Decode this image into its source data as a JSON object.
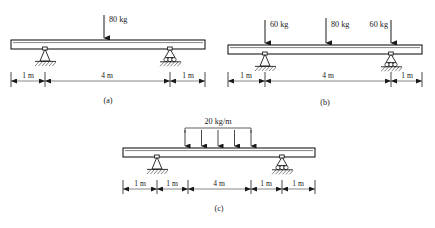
{
  "figure": {
    "background_color": "#ffffff",
    "line_color": "#1a1a1a",
    "dim_line_color": "#555555",
    "units": "m"
  },
  "panels": [
    {
      "id": "a",
      "caption": "(a)",
      "loads": [
        {
          "label": "80 kg",
          "magnitude": 80,
          "unit": "kg",
          "type": "point",
          "position_m": 3.0
        }
      ],
      "supports": [
        {
          "type": "pin",
          "position_m": 1.0
        },
        {
          "type": "roller",
          "position_m": 5.0
        }
      ],
      "dimensions": [
        {
          "label": "1 m",
          "value": 1
        },
        {
          "label": "4 m",
          "value": 4
        },
        {
          "label": "1 m",
          "value": 1
        }
      ],
      "beam_length_m": 6
    },
    {
      "id": "b",
      "caption": "(b)",
      "loads": [
        {
          "label": "60 kg",
          "magnitude": 60,
          "unit": "kg",
          "type": "point",
          "position_m": 1.0
        },
        {
          "label": "80 kg",
          "magnitude": 80,
          "unit": "kg",
          "type": "point",
          "position_m": 3.0
        },
        {
          "label": "60 kg",
          "magnitude": 60,
          "unit": "kg",
          "type": "point",
          "position_m": 5.0
        }
      ],
      "supports": [
        {
          "type": "pin",
          "position_m": 1.0
        },
        {
          "type": "roller",
          "position_m": 5.0
        }
      ],
      "dimensions": [
        {
          "label": "1 m",
          "value": 1
        },
        {
          "label": "4 m",
          "value": 4
        },
        {
          "label": "1 m",
          "value": 1
        }
      ],
      "beam_length_m": 6
    },
    {
      "id": "c",
      "caption": "(c)",
      "loads": [
        {
          "label": "20 kg/m",
          "magnitude": 20,
          "unit": "kg/m",
          "type": "distributed",
          "start_m": 3.0,
          "end_m": 5.0,
          "arrow_count": 5
        }
      ],
      "supports": [
        {
          "type": "pin",
          "position_m": 2.0
        },
        {
          "type": "roller",
          "position_m": 6.0
        }
      ],
      "dimensions": [
        {
          "label": "1 m",
          "value": 1
        },
        {
          "label": "1 m",
          "value": 1
        },
        {
          "label": "4 m",
          "value": 4
        },
        {
          "label": "1 m",
          "value": 1
        },
        {
          "label": "1 m",
          "value": 1
        }
      ],
      "beam_length_m": 8
    }
  ]
}
